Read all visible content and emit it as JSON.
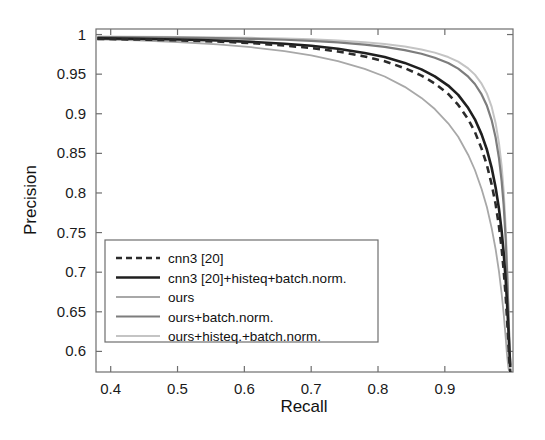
{
  "chart_data": {
    "type": "line",
    "title": "",
    "xlabel": "Recall",
    "ylabel": "Precision",
    "xlim": [
      0.378,
      1.002
    ],
    "ylim": [
      0.574,
      1.007
    ],
    "xticks": [
      0.4,
      0.5,
      0.6,
      0.7,
      0.8,
      0.9
    ],
    "xtick_labels": [
      "0.4",
      "0.5",
      "0.6",
      "0.7",
      "0.8",
      "0.9"
    ],
    "yticks": [
      0.6,
      0.65,
      0.7,
      0.75,
      0.8,
      0.85,
      0.9,
      0.95,
      1.0
    ],
    "ytick_labels": [
      "0.6",
      "0.65",
      "0.7",
      "0.75",
      "0.8",
      "0.85",
      "0.9",
      "0.95",
      "1"
    ],
    "grid": false,
    "legend_position": "lower-left",
    "series": [
      {
        "name": "cnn3 [20]",
        "color": "#2b2b2b",
        "style": "dashed",
        "width": 2.6,
        "points": [
          [
            0.38,
            0.9945
          ],
          [
            0.44,
            0.9938
          ],
          [
            0.5,
            0.9928
          ],
          [
            0.56,
            0.9912
          ],
          [
            0.61,
            0.9892
          ],
          [
            0.66,
            0.9862
          ],
          [
            0.7,
            0.983
          ],
          [
            0.74,
            0.9786
          ],
          [
            0.78,
            0.9724
          ],
          [
            0.81,
            0.9662
          ],
          [
            0.84,
            0.9576
          ],
          [
            0.865,
            0.9482
          ],
          [
            0.885,
            0.9382
          ],
          [
            0.905,
            0.925
          ],
          [
            0.92,
            0.9112
          ],
          [
            0.935,
            0.893
          ],
          [
            0.945,
            0.877
          ],
          [
            0.955,
            0.856
          ],
          [
            0.963,
            0.835
          ],
          [
            0.97,
            0.811
          ],
          [
            0.976,
            0.786
          ],
          [
            0.981,
            0.758
          ],
          [
            0.985,
            0.73
          ],
          [
            0.988,
            0.703
          ],
          [
            0.991,
            0.67
          ],
          [
            0.993,
            0.642
          ],
          [
            0.995,
            0.612
          ],
          [
            0.9965,
            0.588
          ],
          [
            0.998,
            0.574
          ]
        ]
      },
      {
        "name": "cnn3 [20]+histeq+batch.norm.",
        "color": "#1f1f1f",
        "style": "solid",
        "width": 2.6,
        "points": [
          [
            0.38,
            0.9952
          ],
          [
            0.44,
            0.9946
          ],
          [
            0.5,
            0.9938
          ],
          [
            0.56,
            0.9925
          ],
          [
            0.61,
            0.9908
          ],
          [
            0.66,
            0.9884
          ],
          [
            0.7,
            0.9858
          ],
          [
            0.74,
            0.982
          ],
          [
            0.78,
            0.9768
          ],
          [
            0.81,
            0.9716
          ],
          [
            0.84,
            0.9642
          ],
          [
            0.865,
            0.956
          ],
          [
            0.885,
            0.9472
          ],
          [
            0.905,
            0.9356
          ],
          [
            0.92,
            0.9238
          ],
          [
            0.935,
            0.9072
          ],
          [
            0.945,
            0.893
          ],
          [
            0.955,
            0.874
          ],
          [
            0.963,
            0.8545
          ],
          [
            0.97,
            0.832
          ],
          [
            0.976,
            0.807
          ],
          [
            0.981,
            0.78
          ],
          [
            0.985,
            0.752
          ],
          [
            0.988,
            0.725
          ],
          [
            0.991,
            0.691
          ],
          [
            0.993,
            0.662
          ],
          [
            0.995,
            0.63
          ],
          [
            0.9965,
            0.602
          ],
          [
            0.998,
            0.58
          ]
        ]
      },
      {
        "name": "ours",
        "color": "#a8a8a8",
        "style": "solid",
        "width": 1.8,
        "points": [
          [
            0.38,
            0.9938
          ],
          [
            0.44,
            0.9926
          ],
          [
            0.5,
            0.9906
          ],
          [
            0.56,
            0.9876
          ],
          [
            0.61,
            0.984
          ],
          [
            0.66,
            0.979
          ],
          [
            0.7,
            0.9736
          ],
          [
            0.74,
            0.9664
          ],
          [
            0.78,
            0.9566
          ],
          [
            0.81,
            0.947
          ],
          [
            0.84,
            0.934
          ],
          [
            0.865,
            0.92
          ],
          [
            0.885,
            0.906
          ],
          [
            0.905,
            0.888
          ],
          [
            0.92,
            0.871
          ],
          [
            0.935,
            0.848
          ],
          [
            0.945,
            0.829
          ],
          [
            0.955,
            0.805
          ],
          [
            0.963,
            0.782
          ],
          [
            0.97,
            0.756
          ],
          [
            0.976,
            0.729
          ],
          [
            0.981,
            0.701
          ],
          [
            0.985,
            0.673
          ],
          [
            0.988,
            0.648
          ],
          [
            0.991,
            0.618
          ],
          [
            0.993,
            0.596
          ],
          [
            0.995,
            0.58
          ],
          [
            0.9965,
            0.574
          ],
          [
            0.998,
            0.574
          ]
        ]
      },
      {
        "name": "ours+batch.norm.",
        "color": "#7d7d7d",
        "style": "solid",
        "width": 2.2,
        "points": [
          [
            0.38,
            0.9968
          ],
          [
            0.44,
            0.9965
          ],
          [
            0.5,
            0.996
          ],
          [
            0.56,
            0.9954
          ],
          [
            0.61,
            0.9946
          ],
          [
            0.66,
            0.9934
          ],
          [
            0.7,
            0.992
          ],
          [
            0.74,
            0.99
          ],
          [
            0.78,
            0.9872
          ],
          [
            0.81,
            0.9844
          ],
          [
            0.84,
            0.9804
          ],
          [
            0.865,
            0.9758
          ],
          [
            0.885,
            0.9708
          ],
          [
            0.905,
            0.964
          ],
          [
            0.92,
            0.957
          ],
          [
            0.935,
            0.9468
          ],
          [
            0.945,
            0.9376
          ],
          [
            0.955,
            0.9244
          ],
          [
            0.963,
            0.91
          ],
          [
            0.97,
            0.892
          ],
          [
            0.976,
            0.87
          ],
          [
            0.981,
            0.844
          ],
          [
            0.985,
            0.815
          ],
          [
            0.988,
            0.785
          ],
          [
            0.991,
            0.742
          ],
          [
            0.993,
            0.702
          ],
          [
            0.995,
            0.652
          ],
          [
            0.9965,
            0.612
          ],
          [
            0.998,
            0.582
          ]
        ]
      },
      {
        "name": "ours+histeq.+batch.norm.",
        "color": "#c4c4c4",
        "style": "solid",
        "width": 2.0,
        "points": [
          [
            0.38,
            0.9974
          ],
          [
            0.44,
            0.9972
          ],
          [
            0.5,
            0.9969
          ],
          [
            0.56,
            0.9964
          ],
          [
            0.61,
            0.9958
          ],
          [
            0.66,
            0.995
          ],
          [
            0.7,
            0.994
          ],
          [
            0.74,
            0.9924
          ],
          [
            0.78,
            0.9902
          ],
          [
            0.81,
            0.988
          ],
          [
            0.84,
            0.9848
          ],
          [
            0.865,
            0.9812
          ],
          [
            0.885,
            0.9772
          ],
          [
            0.905,
            0.9716
          ],
          [
            0.92,
            0.9658
          ],
          [
            0.935,
            0.9572
          ],
          [
            0.945,
            0.9494
          ],
          [
            0.955,
            0.938
          ],
          [
            0.963,
            0.9254
          ],
          [
            0.97,
            0.909
          ],
          [
            0.976,
            0.888
          ],
          [
            0.981,
            0.863
          ],
          [
            0.985,
            0.834
          ],
          [
            0.988,
            0.803
          ],
          [
            0.991,
            0.758
          ],
          [
            0.993,
            0.715
          ],
          [
            0.995,
            0.66
          ],
          [
            0.9965,
            0.616
          ],
          [
            0.998,
            0.583
          ]
        ]
      }
    ]
  },
  "legend": {
    "items": [
      {
        "label": "cnn3 [20]"
      },
      {
        "label": "cnn3 [20]+histeq+batch.norm."
      },
      {
        "label": "ours"
      },
      {
        "label": "ours+batch.norm."
      },
      {
        "label": "ours+histeq.+batch.norm."
      }
    ]
  },
  "axes": {
    "x_title": "Recall",
    "y_title": "Precision",
    "x_labels": [
      "0.4",
      "0.5",
      "0.6",
      "0.7",
      "0.8",
      "0.9"
    ],
    "y_labels": [
      "1",
      "0.95",
      "0.9",
      "0.85",
      "0.8",
      "0.75",
      "0.7",
      "0.65",
      "0.6"
    ]
  }
}
